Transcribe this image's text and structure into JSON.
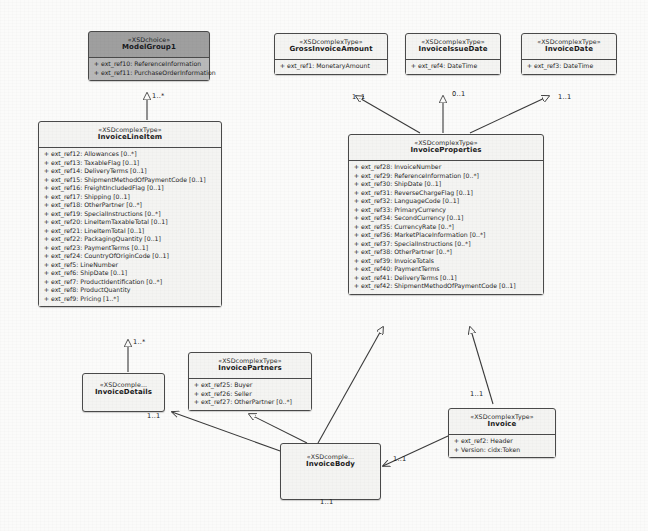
{
  "diagram": {
    "stereotype_choice": "«XSDchoice»",
    "stereotype_complex": "«XSDcomplexType»",
    "stereotype_truncated": "«XSDcomple...",
    "colors": {
      "node_fill": "#f4f4f2",
      "node_fill_shaded": "#9f9f9f",
      "border": "#4a4a4a",
      "text": "#1f1f1f",
      "background": "#fbfbfa"
    }
  },
  "nodes": {
    "model_group1": {
      "stereotype": "«XSDchoice»",
      "name": "ModelGroup1",
      "attributes": [
        "ext_ref10: ReferenceInformation",
        "ext_ref11: PurchaseOrderInformation"
      ]
    },
    "gross_invoice_amount": {
      "stereotype": "«XSDcomplexType»",
      "name": "GrossInvoiceAmount",
      "attributes": [
        "ext_ref1: MonetaryAmount"
      ]
    },
    "invoice_issue_date": {
      "stereotype": "«XSDcomplexType»",
      "name": "InvoiceIssueDate",
      "attributes": [
        "ext_ref4: DateTime"
      ]
    },
    "invoice_date": {
      "stereotype": "«XSDcomplexType»",
      "name": "InvoiceDate",
      "attributes": [
        "ext_ref3: DateTime"
      ]
    },
    "invoice_line_item": {
      "stereotype": "«XSDcomplexType»",
      "name": "InvoiceLineItem",
      "attributes": [
        "ext_ref12: Allowances [0..*]",
        "ext_ref13: TaxableFlag [0..1]",
        "ext_ref14: DeliveryTerms [0..1]",
        "ext_ref15: ShipmentMethodOfPaymentCode [0..1]",
        "ext_ref16: FreightIncludedFlag [0..1]",
        "ext_ref17: Shipping [0..1]",
        "ext_ref18: OtherPartner [0..*]",
        "ext_ref19: SpecialInstructions [0..*]",
        "ext_ref20: LineItemTaxableTotal [0..1]",
        "ext_ref21: LineItemTotal [0..1]",
        "ext_ref22: PackagingQuantity [0..1]",
        "ext_ref23: PaymentTerms [0..1]",
        "ext_ref24: CountryOfOriginCode [0..1]",
        "ext_ref5: LineNumber",
        "ext_ref6: ShipDate [0..1]",
        "ext_ref7: ProductIdentification [0..*]",
        "ext_ref8: ProductQuantity",
        "ext_ref9: Pricing [1..*]"
      ]
    },
    "invoice_properties": {
      "stereotype": "«XSDcomplexType»",
      "name": "InvoiceProperties",
      "attributes": [
        "ext_ref28: InvoiceNumber",
        "ext_ref29: ReferenceInformation [0..*]",
        "ext_ref30: ShipDate [0..1]",
        "ext_ref31: ReverseChargeFlag [0..1]",
        "ext_ref32: LanguageCode [0..1]",
        "ext_ref33: PrimaryCurrency",
        "ext_ref34: SecondCurrency [0..1]",
        "ext_ref35: CurrencyRate [0..*]",
        "ext_ref36: MarketPlaceInformation [0..*]",
        "ext_ref37: SpecialInstructions [0..*]",
        "ext_ref38: OtherPartner [0..*]",
        "ext_ref39: InvoiceTotals",
        "ext_ref40: PaymentTerms",
        "ext_ref41: DeliveryTerms [0..1]",
        "ext_ref42: ShipmentMethodOfPaymentCode [0..1]"
      ]
    },
    "invoice_details": {
      "stereotype": "«XSDcomple...",
      "name": "InvoiceDetails",
      "attributes": []
    },
    "invoice_partners": {
      "stereotype": "«XSDcomplexType»",
      "name": "InvoicePartners",
      "attributes": [
        "ext_ref25: Buyer",
        "ext_ref26: Seller",
        "ext_ref27: OtherPartner [0..*]"
      ]
    },
    "invoice_body": {
      "stereotype": "«XSDcomple...",
      "name": "InvoiceBody",
      "attributes": []
    },
    "invoice": {
      "stereotype": "«XSDcomplexType»",
      "name": "Invoice",
      "attributes": [
        "ext_ref2: Header",
        "Version: cidx:Token"
      ]
    }
  },
  "multiplicities": [
    {
      "id": "m_modelgroup_line",
      "label": "1..*"
    },
    {
      "id": "m_gross_props",
      "label": "1..1"
    },
    {
      "id": "m_issue_props",
      "label": "0..1"
    },
    {
      "id": "m_date_props",
      "label": "1..1"
    },
    {
      "id": "m_lineitem_details",
      "label": "1..*"
    },
    {
      "id": "m_details_body",
      "label": "1..1"
    },
    {
      "id": "m_body_invoice",
      "label": "1..1"
    },
    {
      "id": "m_props_invoice",
      "label": "1..1"
    },
    {
      "id": "m_invoice_body",
      "label": "1..1"
    }
  ]
}
